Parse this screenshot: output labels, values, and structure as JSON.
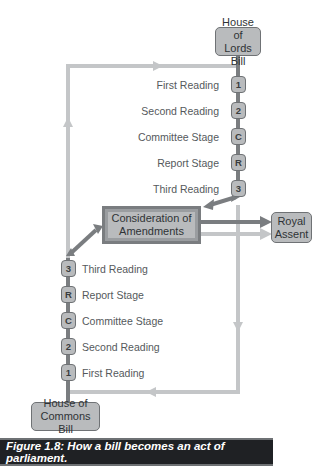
{
  "figure": {
    "caption": "Figure 1.8:  How a bill becomes an act of parliament."
  },
  "lords": {
    "title_line1": "House of",
    "title_line2": "Lords Bill",
    "stages": [
      {
        "badge": "1",
        "label": "First Reading"
      },
      {
        "badge": "2",
        "label": "Second Reading"
      },
      {
        "badge": "C",
        "label": "Committee Stage"
      },
      {
        "badge": "R",
        "label": "Report Stage"
      },
      {
        "badge": "3",
        "label": "Third Reading"
      }
    ]
  },
  "commons": {
    "title_line1": "House of",
    "title_line2": "Commons Bill",
    "stages": [
      {
        "badge": "3",
        "label": "Third Reading"
      },
      {
        "badge": "R",
        "label": "Report Stage"
      },
      {
        "badge": "C",
        "label": "Committee Stage"
      },
      {
        "badge": "2",
        "label": "Second Reading"
      },
      {
        "badge": "1",
        "label": "First Reading"
      }
    ]
  },
  "consideration": {
    "line1": "Consideration of",
    "line2": "Amendments"
  },
  "royal_assent": {
    "line1": "Royal",
    "line2": "Assent"
  },
  "colors": {
    "box_fill": "#b9bbbd",
    "box_border": "#6f7275",
    "dark_line": "#7a7d80",
    "light_line": "#c4c6c8",
    "caption_bg": "#1f2124",
    "caption_text": "#ffffff"
  }
}
